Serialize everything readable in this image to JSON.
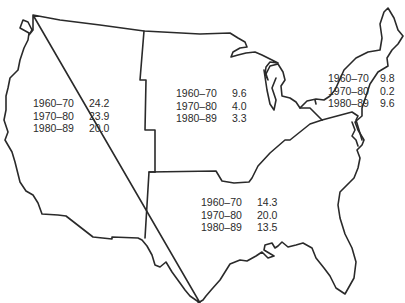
{
  "map": {
    "subject": "United States regions",
    "border_color": "#2a2a2a",
    "regions": [
      {
        "id": "west",
        "rows": [
          {
            "period": "1960–70",
            "value": "24.2"
          },
          {
            "period": "1970–80",
            "value": "23.9"
          },
          {
            "period": "1980–89",
            "value": "20.0"
          }
        ]
      },
      {
        "id": "midwest",
        "rows": [
          {
            "period": "1960–70",
            "value": "9.6"
          },
          {
            "period": "1970–80",
            "value": "4.0"
          },
          {
            "period": "1980–89",
            "value": "3.3"
          }
        ]
      },
      {
        "id": "northeast",
        "rows": [
          {
            "period": "1960–70",
            "value": "9.8"
          },
          {
            "period": "1970–80",
            "value": "0.2"
          },
          {
            "period": "1980–89",
            "value": "9.6"
          }
        ]
      },
      {
        "id": "south",
        "rows": [
          {
            "period": "1960–70",
            "value": "14.3"
          },
          {
            "period": "1970–80",
            "value": "20.0"
          },
          {
            "period": "1980–89",
            "value": "13.5"
          }
        ]
      }
    ]
  }
}
